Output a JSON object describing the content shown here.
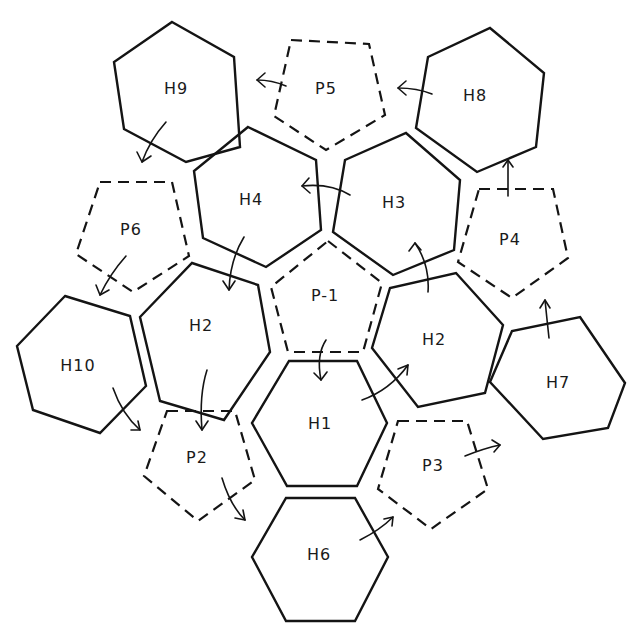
{
  "diagram": {
    "title": "",
    "background": "#ffffff",
    "stroke_color": "#141414",
    "shapes": [
      {
        "id": "H9",
        "label": "H9",
        "kind": "hexagon",
        "style": "solid",
        "points": "172,22 234,57 240,147 186,162 124,129 114,62",
        "label_xy": [
          176,
          89
        ]
      },
      {
        "id": "P5",
        "label": "P5",
        "kind": "pentagon",
        "style": "dashed",
        "points": "291,40 369,44 385,115 326,150 274,116",
        "label_xy": [
          326,
          89
        ]
      },
      {
        "id": "H8",
        "label": "H8",
        "kind": "hexagon",
        "style": "solid",
        "points": "490,28 544,73 536,147 477,172 416,128 428,57",
        "label_xy": [
          475,
          96
        ]
      },
      {
        "id": "H4",
        "label": "H4",
        "kind": "hexagon",
        "style": "solid",
        "points": "248,127 316,160 321,230 266,267 203,238 194,171",
        "label_xy": [
          251,
          200
        ]
      },
      {
        "id": "H3",
        "label": "H3",
        "kind": "hexagon",
        "style": "solid",
        "points": "406,133 460,180 454,250 393,275 333,232 345,160",
        "label_xy": [
          394,
          203
        ]
      },
      {
        "id": "P6",
        "label": "P6",
        "kind": "pentagon",
        "style": "dashed",
        "points": "100,182 172,182 189,256 133,292 76,254",
        "label_xy": [
          131,
          230
        ]
      },
      {
        "id": "P4",
        "label": "P4",
        "kind": "pentagon",
        "style": "dashed",
        "points": "479,189 553,189 568,258 512,298 458,262",
        "label_xy": [
          510,
          240
        ]
      },
      {
        "id": "P-1",
        "label": "P-1",
        "kind": "pentagon",
        "style": "dashed",
        "points": "328,241 382,283 363,352 288,352 271,287",
        "label_xy": [
          325,
          296
        ]
      },
      {
        "id": "H2L",
        "label": "H2",
        "kind": "hexagon",
        "style": "solid",
        "points": "192,263 258,285 270,352 224,420 160,401 140,317",
        "label_xy": [
          201,
          326
        ]
      },
      {
        "id": "H2R",
        "label": "H2",
        "kind": "hexagon",
        "style": "solid",
        "points": "456,273 503,325 485,393 418,407 372,348 390,288",
        "label_xy": [
          434,
          340
        ]
      },
      {
        "id": "H10",
        "label": "H10",
        "kind": "hexagon",
        "style": "solid",
        "points": "65,296 130,316 146,386 100,433 33,410 17,346",
        "label_xy": [
          78,
          366
        ]
      },
      {
        "id": "H7",
        "label": "H7",
        "kind": "hexagon",
        "style": "solid",
        "points": "580,317 625,383 608,428 543,439 490,382 512,331",
        "label_xy": [
          558,
          383
        ]
      },
      {
        "id": "H1",
        "label": "H1",
        "kind": "hexagon",
        "style": "solid",
        "points": "289,361 357,361 387,423 357,486 287,486 252,423",
        "label_xy": [
          320,
          424
        ]
      },
      {
        "id": "P2",
        "label": "P2",
        "kind": "pentagon",
        "style": "dashed",
        "points": "167,411 235,411 255,480 198,521 144,476",
        "label_xy": [
          197,
          458
        ]
      },
      {
        "id": "P3",
        "label": "P3",
        "kind": "pentagon",
        "style": "dashed",
        "points": "398,421 467,421 488,489 431,529 378,489",
        "label_xy": [
          433,
          466
        ]
      },
      {
        "id": "H6",
        "label": "H6",
        "kind": "hexagon",
        "style": "solid",
        "points": "286,498 355,498 388,557 355,621 286,621 252,557",
        "label_xy": [
          319,
          555
        ]
      }
    ],
    "arrows": [
      {
        "from": "H8",
        "to": "P5",
        "path": "M 432,94 Q 417,88 398,88",
        "head": "M 406,81 L 398,88 L 406,95"
      },
      {
        "from": "P5",
        "to": "H9",
        "path": "M 286,86 Q 272,80 257,80",
        "head": "M 265,73 L 257,80 L 265,87"
      },
      {
        "from": "H9",
        "to": "P6",
        "path": "M 166,122 Q 150,140 142,162",
        "head": "M 137,152 L 142,162 L 151,156"
      },
      {
        "from": "P6",
        "to": "H10",
        "path": "M 126,256 Q 110,274 100,295",
        "head": "M 96,285 L 100,295 L 109,290"
      },
      {
        "from": "H3",
        "to": "H4",
        "path": "M 350,195 Q 330,183 302,186",
        "head": "M 309,178 L 302,186 L 310,193"
      },
      {
        "from": "H4",
        "to": "H2L",
        "path": "M 244,237 Q 230,260 229,290",
        "head": "M 223,281 L 229,290 L 235,281"
      },
      {
        "from": "H2L",
        "to": "P2",
        "path": "M 207,370 Q 199,395 202,430",
        "head": "M 196,421 L 202,430 L 208,421"
      },
      {
        "from": "H10",
        "to": "P2",
        "path": "M 113,388 Q 122,414 140,430",
        "head": "M 131,430 L 140,430 L 138,421"
      },
      {
        "from": "P2",
        "to": "H6",
        "path": "M 222,478 Q 230,505 245,520",
        "head": "M 235,518 L 245,520 L 243,510"
      },
      {
        "from": "P-1",
        "to": "H1",
        "path": "M 326,340 Q 316,355 321,380",
        "head": "M 314,373 L 321,380 L 327,372"
      },
      {
        "from": "H1",
        "to": "H2R",
        "path": "M 362,400 Q 390,390 408,365",
        "head": "M 398,369 L 408,365 L 407,375"
      },
      {
        "from": "H2R",
        "to": "H3",
        "path": "M 428,292 Q 430,265 415,243",
        "head": "M 409,251 L 415,243 L 421,250"
      },
      {
        "from": "H6",
        "to": "P3",
        "path": "M 360,540 Q 380,530 393,517",
        "head": "M 384,519 L 393,517 L 392,526"
      },
      {
        "from": "P3",
        "to": "H7",
        "path": "M 465,456 Q 485,448 500,445",
        "head": "M 492,440 L 500,445 L 494,452"
      },
      {
        "from": "H7",
        "to": "P4",
        "path": "M 549,338 Q 547,320 545,300",
        "head": "M 540,308 L 545,300 L 550,308"
      },
      {
        "from": "P4",
        "to": "H8",
        "path": "M 508,196 Q 508,180 508,160",
        "head": "M 503,167 L 508,160 L 513,167"
      }
    ]
  }
}
